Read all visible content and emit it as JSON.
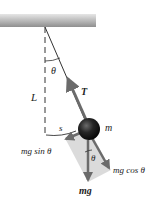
{
  "figure": {
    "type": "simple pendulum free-body diagram",
    "labels": {
      "angle": "θ",
      "length": "L",
      "tension": "T",
      "mass": "m",
      "arc_length": "s",
      "tangential_component": "mg sin θ",
      "radial_component": "mg cos θ",
      "weight": "mg",
      "weight_angle": "θ"
    },
    "colors": {
      "ceiling": "#9a9a9a",
      "string": "#333333",
      "arrow": "#6b6b6b",
      "shaded_region": "#d6d6d6",
      "bob": "#1a1a1a",
      "text": "#222222"
    }
  }
}
